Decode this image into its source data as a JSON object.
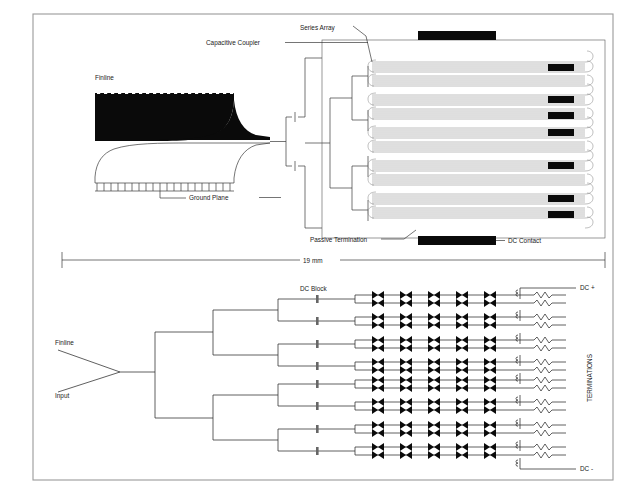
{
  "figure": {
    "border_color": "#9a9a9a",
    "background": "#ffffff"
  },
  "top_diagram": {
    "title": "finline-fed series array layout",
    "labels": {
      "finline": "Finline",
      "ground_plane": "Ground Plane",
      "capacitive_coupler": "Capacitive Coupler",
      "series_array": "Series Array",
      "passive_termination": "Passive Termination",
      "dc_contact": "DC Contact"
    },
    "dimension": {
      "value": "19 mm"
    },
    "array": {
      "row_count": 16,
      "group_count": 8,
      "dc_pad_count": 7,
      "top_bar": true,
      "bottom_bar": true
    },
    "colors": {
      "trace": "#8a8a8a",
      "metal": "#0a0a0a",
      "outline": "#3a3a3a"
    }
  },
  "bottom_diagram": {
    "title": "equivalent circuit schematic",
    "labels": {
      "finline": "Finline",
      "input": "Input",
      "dc_block": "DC Block",
      "terminations": "TERMINATIONS",
      "dc_plus": "DC +",
      "dc_minus": "DC -"
    },
    "network": {
      "branch_rows": 16,
      "dc_block_count": 8,
      "diodes_per_row": 5,
      "splitter_stages": 4
    },
    "colors": {
      "wire": "#2b2b2b",
      "symbol": "#111111"
    }
  }
}
